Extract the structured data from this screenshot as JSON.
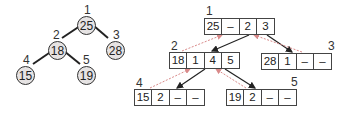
{
  "colors": {
    "node_fill": "#e6e3e3",
    "edge": "#222222",
    "child_pointer": "#222222",
    "parent_pointer": "#d98a8a"
  },
  "tree": {
    "nodes": [
      {
        "index": "1",
        "value": "25"
      },
      {
        "index": "2",
        "value": "18"
      },
      {
        "index": "3",
        "value": "28"
      },
      {
        "index": "4",
        "value": "15"
      },
      {
        "index": "5",
        "value": "19"
      }
    ],
    "edges": [
      [
        "1",
        "2"
      ],
      [
        "1",
        "3"
      ],
      [
        "2",
        "4"
      ],
      [
        "2",
        "5"
      ]
    ]
  },
  "records": {
    "fields": [
      "value",
      "parent",
      "left",
      "right"
    ],
    "items": [
      {
        "index": "1",
        "cells": [
          "25",
          "–",
          "2",
          "3"
        ]
      },
      {
        "index": "2",
        "cells": [
          "18",
          "1",
          "4",
          "5"
        ]
      },
      {
        "index": "3",
        "cells": [
          "28",
          "1",
          "–",
          "–"
        ]
      },
      {
        "index": "4",
        "cells": [
          "15",
          "2",
          "–",
          "–"
        ]
      },
      {
        "index": "5",
        "cells": [
          "19",
          "2",
          "–",
          "–"
        ]
      }
    ]
  }
}
